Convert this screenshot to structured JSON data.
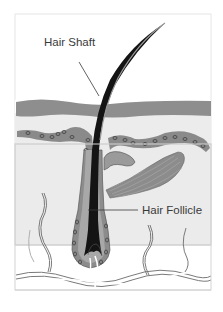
{
  "diagram": {
    "labels": {
      "hair_shaft": "Hair Shaft",
      "hair_follicle": "Hair Follicle"
    },
    "colors": {
      "background": "#ffffff",
      "skin_fill": "#ebebeb",
      "epidermis": "#8d8d8d",
      "dermis_band": "#8a8a8a",
      "hair": "#141414",
      "hair_sheath": "#9c9c9c",
      "frame_border": "#d8d8d8"
    },
    "structures": [
      "hair-shaft",
      "epidermis",
      "blood-vessel-band",
      "sebaceous-gland",
      "arrector-pili-muscle",
      "hair-follicle",
      "hair-bulb",
      "nerve-fibers"
    ]
  }
}
